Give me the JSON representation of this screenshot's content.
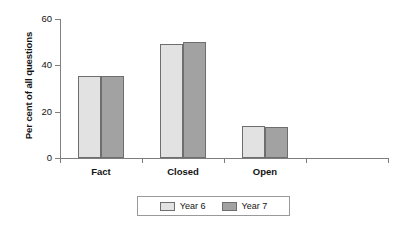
{
  "chart_data": {
    "type": "bar",
    "title": "",
    "subtitle": "",
    "xlabel": "",
    "ylabel": "Per cent of all questions",
    "categories": [
      "Fact",
      "Closed",
      "Open",
      ""
    ],
    "series": [
      {
        "name": "Year 6",
        "color": "#e2e2e2",
        "values": [
          35.5,
          49.2,
          14.0,
          null
        ]
      },
      {
        "name": "Year 7",
        "color": "#a2a2a2",
        "values": [
          35.5,
          50.2,
          13.5,
          null
        ]
      }
    ],
    "ylim": [
      0,
      60
    ],
    "yticks": [
      0,
      20,
      40,
      60
    ],
    "ytick_labels": [
      "0",
      "20",
      "40",
      "60"
    ],
    "grid": false,
    "legend_position": "bottom",
    "legend_entries": [
      "Year 6",
      "Year 7"
    ]
  }
}
